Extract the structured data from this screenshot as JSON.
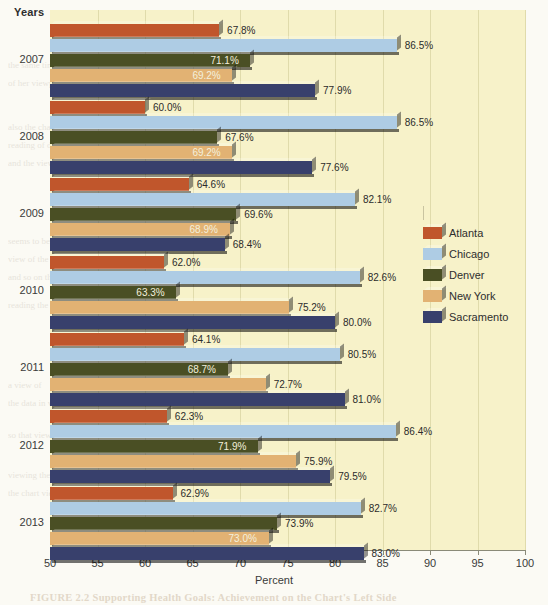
{
  "axis": {
    "y_title": "Years",
    "x_title": "Percent",
    "x_ticks": [
      "50",
      "55",
      "60",
      "65",
      "70",
      "75",
      "80",
      "85",
      "90",
      "95",
      "100"
    ]
  },
  "legend": {
    "items": [
      {
        "label": "Atlanta",
        "color": "#c0562c"
      },
      {
        "label": "Chicago",
        "color": "#aecce4"
      },
      {
        "label": "Denver",
        "color": "#4a4f24"
      },
      {
        "label": "New York",
        "color": "#e2b273"
      },
      {
        "label": "Sacramento",
        "color": "#38406c"
      }
    ]
  },
  "bleed": {
    "caption": "FIGURE 2.2  Supporting Health Goals: Achievement on the Chart's Left Side"
  },
  "chart_data": {
    "type": "bar",
    "orientation": "horizontal",
    "title": "",
    "xlabel": "Percent",
    "ylabel": "Years",
    "xlim": [
      50,
      100
    ],
    "grid": true,
    "legend_position": "right",
    "categories": [
      "2007",
      "2008",
      "2009",
      "2010",
      "2011",
      "2012",
      "2013"
    ],
    "series": [
      {
        "name": "Atlanta",
        "color": "#c0562c",
        "values": [
          67.8,
          60.0,
          64.6,
          62.0,
          64.1,
          62.3,
          62.9
        ],
        "labels": [
          "67.8%",
          "60.0%",
          "64.6%",
          "62.0%",
          "64.1%",
          "62.3%",
          "62.9%"
        ]
      },
      {
        "name": "Chicago",
        "color": "#aecce4",
        "values": [
          86.5,
          86.5,
          82.1,
          82.6,
          80.5,
          86.4,
          82.7
        ],
        "labels": [
          "86.5%",
          "86.5%",
          "82.1%",
          "82.6%",
          "80.5%",
          "86.4%",
          "82.7%"
        ]
      },
      {
        "name": "Denver",
        "color": "#4a4f24",
        "values": [
          71.1,
          67.6,
          69.6,
          63.3,
          68.7,
          71.9,
          73.9
        ],
        "labels": [
          "71.1%",
          "67.6%",
          "69.6%",
          "63.3%",
          "68.7%",
          "71.9%",
          "73.9%"
        ]
      },
      {
        "name": "New York",
        "color": "#e2b273",
        "values": [
          69.2,
          69.2,
          68.9,
          75.2,
          72.7,
          75.9,
          73.0
        ],
        "labels": [
          "69.2%",
          "69.2%",
          "68.9%",
          "75.2%",
          "72.7%",
          "75.9%",
          "73.0%"
        ]
      },
      {
        "name": "Sacramento",
        "color": "#38406c",
        "values": [
          77.9,
          77.6,
          68.4,
          80.0,
          81.0,
          79.5,
          83.0
        ],
        "labels": [
          "77.9%",
          "77.6%",
          "68.4%",
          "80.0%",
          "81.0%",
          "79.5%",
          "83.0%"
        ]
      }
    ],
    "label_placement": {
      "inside": [
        [
          "Denver",
          "2007"
        ],
        [
          "New York",
          "2007"
        ],
        [
          "New York",
          "2008"
        ],
        [
          "New York",
          "2009"
        ],
        [
          "Denver",
          "2010"
        ],
        [
          "Denver",
          "2011"
        ],
        [
          "Denver",
          "2012"
        ],
        [
          "New York",
          "2013"
        ]
      ]
    }
  }
}
